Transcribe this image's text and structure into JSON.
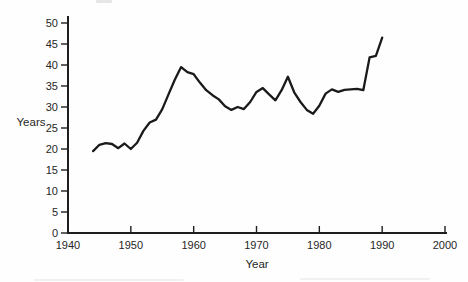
{
  "figure": {
    "background_color": "#fefefe",
    "axis_color": "#1e1e1e",
    "line_color": "#1a1a1a",
    "text_color": "#262626"
  },
  "chart_data": {
    "type": "line",
    "title": "",
    "xlabel": "Year",
    "ylabel": "Years",
    "xlim": [
      1940,
      2000
    ],
    "ylim": [
      0,
      50
    ],
    "x_ticks": [
      1940,
      1950,
      1960,
      1970,
      1980,
      1990,
      2000
    ],
    "y_ticks": [
      0,
      5,
      10,
      15,
      20,
      25,
      30,
      35,
      40,
      45,
      50
    ],
    "grid": false,
    "legend": null,
    "series": [
      {
        "name": "years-line",
        "x": [
          1944,
          1945,
          1946,
          1947,
          1948,
          1949,
          1950,
          1951,
          1952,
          1953,
          1954,
          1955,
          1956,
          1957,
          1958,
          1959,
          1960,
          1961,
          1962,
          1963,
          1964,
          1965,
          1966,
          1967,
          1968,
          1969,
          1970,
          1971,
          1972,
          1973,
          1974,
          1975,
          1976,
          1977,
          1978,
          1979,
          1980,
          1981,
          1982,
          1983,
          1984,
          1985,
          1986,
          1987,
          1988,
          1989,
          1990
        ],
        "y": [
          19.5,
          21.0,
          21.4,
          21.2,
          20.2,
          21.3,
          20.0,
          21.5,
          24.3,
          26.3,
          27.0,
          29.5,
          33.0,
          36.5,
          39.5,
          38.3,
          37.8,
          35.8,
          34.0,
          32.8,
          31.8,
          30.2,
          29.3,
          30.0,
          29.5,
          31.2,
          33.6,
          34.5,
          33.0,
          31.6,
          34.0,
          37.2,
          33.5,
          31.2,
          29.3,
          28.4,
          30.3,
          33.2,
          34.2,
          33.6,
          34.1,
          34.2,
          34.3,
          34.0,
          41.8,
          42.2,
          46.5
        ]
      }
    ]
  }
}
